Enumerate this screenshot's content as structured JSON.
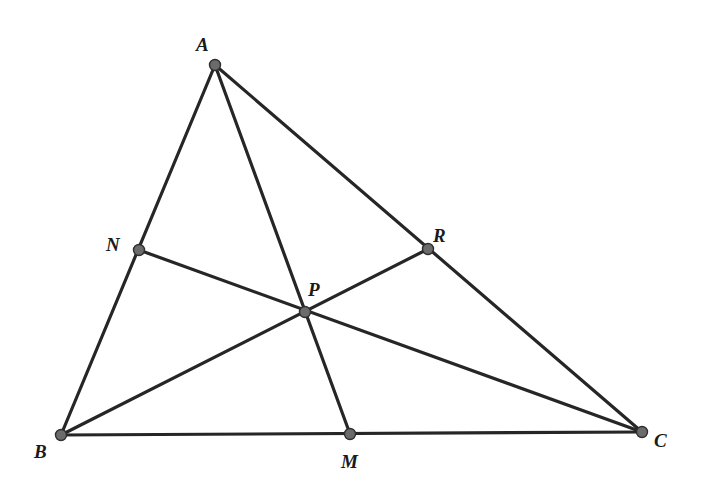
{
  "diagram": {
    "type": "geometry",
    "colors": {
      "line": "#262626",
      "point_fill": "#6b6b6b",
      "point_stroke": "#2e2e2e",
      "label": "#1a1a1a",
      "background": "#ffffff"
    },
    "points": {
      "A": {
        "label": "A",
        "x": 215,
        "y": 65,
        "lx": 196,
        "ly": 51
      },
      "B": {
        "label": "B",
        "x": 61,
        "y": 435,
        "lx": 34,
        "ly": 458
      },
      "C": {
        "label": "C",
        "x": 642,
        "y": 432,
        "lx": 654,
        "ly": 447
      },
      "N": {
        "label": "N",
        "x": 139,
        "y": 250,
        "lx": 106,
        "ly": 251
      },
      "R": {
        "label": "R",
        "x": 428,
        "y": 249,
        "lx": 433,
        "ly": 242
      },
      "M": {
        "label": "M",
        "x": 350,
        "y": 434,
        "lx": 341,
        "ly": 468
      },
      "P": {
        "label": "P",
        "x": 305,
        "y": 312,
        "lx": 308,
        "ly": 296
      }
    },
    "segments": [
      {
        "from": "A",
        "to": "B",
        "name": "side-AB"
      },
      {
        "from": "B",
        "to": "C",
        "name": "side-BC"
      },
      {
        "from": "C",
        "to": "A",
        "name": "side-CA"
      },
      {
        "from": "A",
        "to": "M",
        "name": "cevian-AM"
      },
      {
        "from": "B",
        "to": "R",
        "name": "cevian-BR"
      },
      {
        "from": "C",
        "to": "N",
        "name": "cevian-CN"
      }
    ]
  }
}
